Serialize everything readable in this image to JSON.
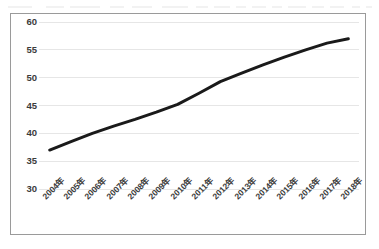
{
  "chart_data": {
    "type": "line",
    "title": "",
    "subtitle": "",
    "xlabel": "",
    "ylabel": "",
    "categories": [
      "2004年",
      "2005年",
      "2006年",
      "2007年",
      "2008年",
      "2009年",
      "2010年",
      "2011年",
      "2012年",
      "2013年",
      "2014年",
      "2015年",
      "2016年",
      "2017年",
      "2018年"
    ],
    "values": [
      37.0,
      38.5,
      40.0,
      41.3,
      42.5,
      43.8,
      45.2,
      47.2,
      49.3,
      50.8,
      52.3,
      53.7,
      55.0,
      56.2,
      57.0
    ],
    "series": [
      {
        "name": "",
        "values": [
          37.0,
          38.5,
          40.0,
          41.3,
          42.5,
          43.8,
          45.2,
          47.2,
          49.3,
          50.8,
          52.3,
          53.7,
          55.0,
          56.2,
          57.0
        ],
        "color": "#1a1a1a",
        "line_width": 3,
        "markers": false
      }
    ],
    "ylim": [
      30,
      60
    ],
    "ytick_labels": [
      "30",
      "35",
      "40",
      "45",
      "50",
      "55",
      "60"
    ],
    "ytick_values": [
      30,
      35,
      40,
      45,
      50,
      55,
      60
    ],
    "xtick_rotation_deg": -45,
    "grid": {
      "horizontal": true,
      "vertical": false,
      "color": "#e6e6e6"
    },
    "legend": {
      "visible": false,
      "position": "none",
      "entries": []
    },
    "annotations": [],
    "plot_background": "#ffffff",
    "frame_border_color": "#9a9a9a"
  },
  "artifacts": {
    "top_strip_note": "",
    "smudges": [
      {
        "left": 8,
        "width": 24
      },
      {
        "left": 46,
        "width": 18
      },
      {
        "left": 70,
        "width": 30
      },
      {
        "left": 110,
        "width": 14
      },
      {
        "left": 132,
        "width": 20
      },
      {
        "left": 162,
        "width": 26
      },
      {
        "left": 196,
        "width": 12
      },
      {
        "left": 214,
        "width": 16
      },
      {
        "left": 236,
        "width": 10
      },
      {
        "left": 252,
        "width": 14
      },
      {
        "left": 272,
        "width": 10
      },
      {
        "left": 288,
        "width": 18
      },
      {
        "left": 312,
        "width": 12
      },
      {
        "left": 330,
        "width": 14
      },
      {
        "left": 352,
        "width": 8
      },
      {
        "left": 366,
        "width": 6
      }
    ]
  }
}
